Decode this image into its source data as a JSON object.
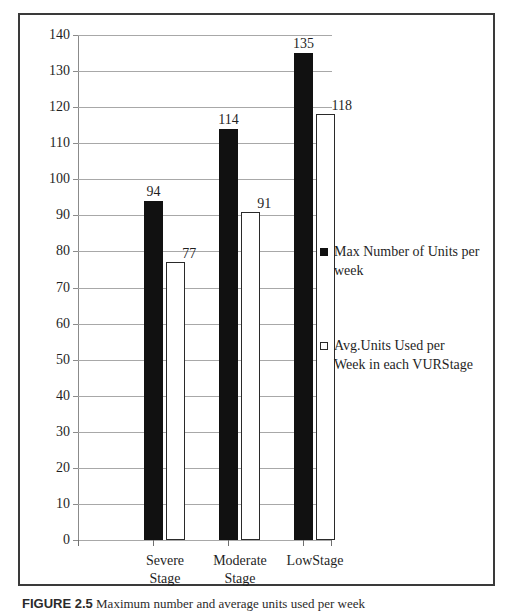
{
  "figure": {
    "caption_label": "FIGURE 2.5",
    "caption_text": " Maximum number and average units used per week"
  },
  "legend": {
    "entries": [
      {
        "marker": "filled-square-marker",
        "label": "Max Number of Units per\nweek"
      },
      {
        "marker": "hollow-square-marker",
        "label": "Avg.Units Used per\n  Week in each VURStage"
      }
    ]
  },
  "chart_data": {
    "type": "bar",
    "title": "",
    "subtitle": "",
    "xlabel": "",
    "ylabel": "",
    "ylim": [
      0,
      140
    ],
    "ytick_step": 10,
    "yticks": [
      0,
      10,
      20,
      30,
      40,
      50,
      60,
      70,
      80,
      90,
      100,
      110,
      120,
      130,
      140
    ],
    "ytick_labels": [
      "0",
      "10",
      "20",
      "30",
      "40",
      "50",
      "60",
      "70",
      "80",
      "90",
      "100",
      "110",
      "120",
      "130",
      "140"
    ],
    "grid": true,
    "legend_position": "right",
    "categories": [
      "Severe Stage",
      "Moderate Stage",
      "Low Stage"
    ],
    "category_lines": [
      [
        "Severe",
        "Stage"
      ],
      [
        "Moderate",
        "Stage"
      ],
      [
        "LowStage",
        ""
      ]
    ],
    "series": [
      {
        "name": "Max Number of Units per week",
        "color": "#111111",
        "fill": "solid",
        "values": [
          94,
          114,
          135
        ],
        "labels": [
          "94",
          "114",
          "135"
        ]
      },
      {
        "name": "Avg.Units Used per Week in each VURStage",
        "color": "#ffffff",
        "fill": "hollow",
        "values": [
          77,
          91,
          118
        ],
        "labels": [
          "77",
          "91",
          "118"
        ]
      }
    ]
  },
  "colors": {
    "series_max": "#111111",
    "series_avg": "#ffffff",
    "gridline": "#a8a8a8",
    "axis": "#8b8b8b",
    "frame": "#3a3a3a",
    "text": "#1f1f1f"
  }
}
